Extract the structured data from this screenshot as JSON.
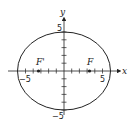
{
  "diagram": {
    "type": "ellipse",
    "axes": {
      "x_label": "x",
      "y_label": "y"
    },
    "tick_labels": {
      "x_neg": "−5",
      "x_pos": "5",
      "y_pos": "5",
      "y_neg": "−5"
    },
    "ellipse": {
      "a": 6,
      "b": 5,
      "center": [
        0,
        0
      ]
    },
    "foci": [
      {
        "label": "F",
        "x": 3.3,
        "y": 0
      },
      {
        "label": "F'",
        "x": -3.3,
        "y": 0
      }
    ],
    "colors": {
      "stroke": "#222222"
    }
  }
}
